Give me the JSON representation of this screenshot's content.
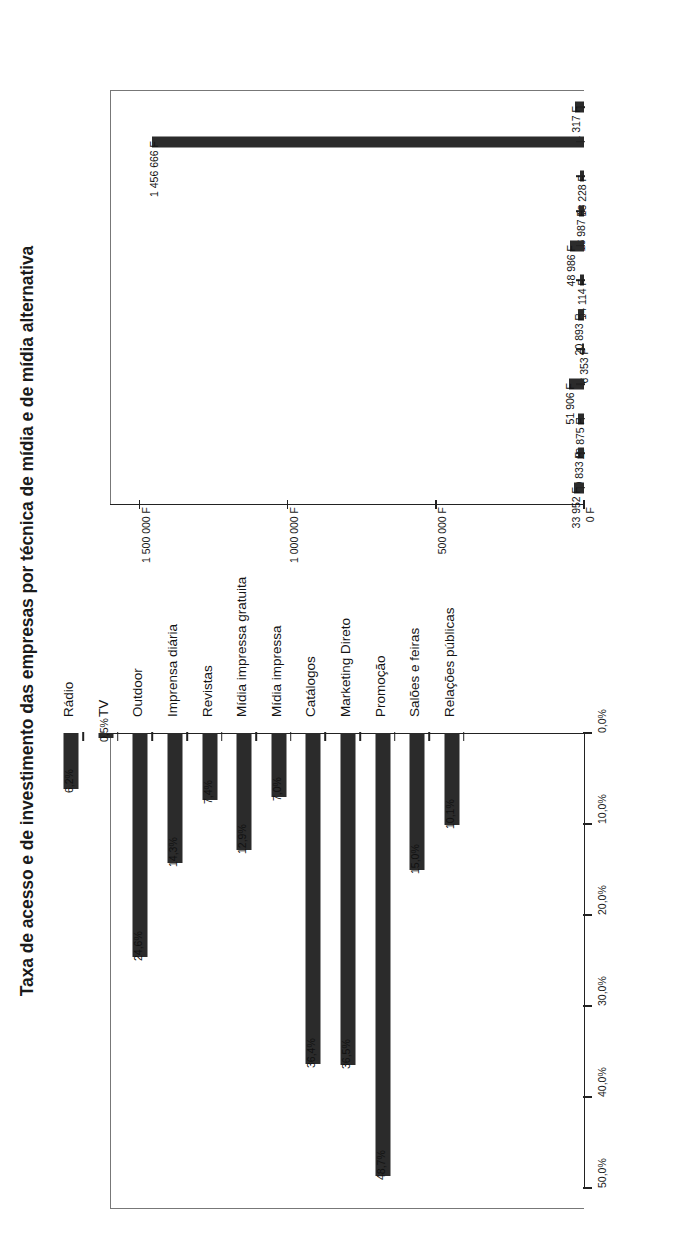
{
  "chart": {
    "title": "Taxa de acesso e de investimento das empresas por técnica de mídia e de mídia alternativa"
  },
  "chart_data": {
    "type": "bar",
    "title": "Taxa de acesso e de investimento das empresas por técnica de mídia e de mídia alternativa",
    "orientation": "rotated-90",
    "grid": false,
    "legend": "none",
    "categories": [
      "Rádio",
      "TV",
      "Outdoor",
      "Imprensa diária",
      "Revistas",
      "Mídia impressa gratuita",
      "Mídia impressa",
      "Catálogos",
      "Marketing Direto",
      "Promoção",
      "Salões e feiras",
      "Relações públicas"
    ],
    "panels": [
      {
        "name": "investimento",
        "xlabel": "",
        "ylabel": "",
        "unit": "F",
        "axis_ticks": [
          "0 F",
          "500 000 F",
          "1 000 000 F",
          "1 500 000 F"
        ],
        "axis_tick_values": [
          0,
          500000,
          1000000,
          1500000
        ],
        "ylim": [
          0,
          1600000
        ],
        "values": [
          31317,
          1456666,
          13228,
          16987,
          48986,
          14114,
          20893,
          6353,
          51906,
          19875,
          20833,
          33952
        ],
        "labels": [
          "31 317 F",
          "1 456 666 F",
          "13 228 F",
          "16 987 F",
          "48 986 F",
          "14 114 F",
          "20 893 F",
          "6 353 F",
          "51 906 F",
          "19 875 F",
          "20 833 F",
          "33 952 F"
        ]
      },
      {
        "name": "taxa de acesso",
        "xlabel": "",
        "ylabel": "",
        "unit": "%",
        "axis_ticks": [
          "0,0%",
          "10,0%",
          "20,0%",
          "30,0%",
          "40,0%",
          "50,0%"
        ],
        "axis_tick_values": [
          0,
          10,
          20,
          30,
          40,
          50
        ],
        "ylim": [
          0,
          50
        ],
        "values": [
          6.2,
          0.5,
          24.6,
          14.3,
          7.4,
          12.9,
          7.0,
          36.4,
          36.5,
          48.7,
          15.0,
          10.1
        ],
        "labels": [
          "6,2%",
          "0,5%",
          "24,6%",
          "14,3%",
          "7,4%",
          "12,9%",
          "7,0%",
          "36,4%",
          "36,5%",
          "48,7%",
          "15,0%",
          "10,1%"
        ]
      }
    ],
    "colors": {
      "bar": "#2b2b2b",
      "axis": "#222222",
      "frame": "#777777",
      "text": "#1a1a1a",
      "background": "#ffffff"
    }
  }
}
